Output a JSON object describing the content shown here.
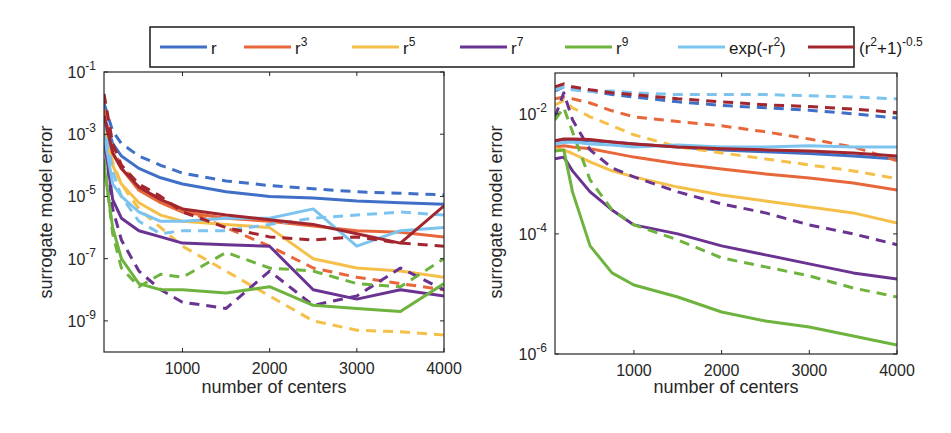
{
  "legend": {
    "position": "top-outside",
    "entries": [
      {
        "key": "r",
        "base": "r",
        "sup": "",
        "suffix": "",
        "color": "#3f6fc6"
      },
      {
        "key": "r3",
        "base": "r",
        "sup": "3",
        "suffix": "",
        "color": "#e8673a"
      },
      {
        "key": "r5",
        "base": "r",
        "sup": "5",
        "suffix": "",
        "color": "#f5c04a"
      },
      {
        "key": "r7",
        "base": "r",
        "sup": "7",
        "suffix": "",
        "color": "#6a3391"
      },
      {
        "key": "r9",
        "base": "r",
        "sup": "9",
        "suffix": "",
        "color": "#6fb33f"
      },
      {
        "key": "exp",
        "base": "exp(-r",
        "sup": "2",
        "suffix": ")",
        "color": "#7cc4ef"
      },
      {
        "key": "imq",
        "base": "(r",
        "sup": "2",
        "suffix": "+1)",
        "sup2": "-0.5",
        "color": "#a3262e"
      }
    ]
  },
  "chart_data": [
    {
      "type": "line",
      "title": "",
      "xlabel": "number of centers",
      "ylabel": "surrogate model error",
      "yscale": "log",
      "xlim": [
        100,
        4000
      ],
      "ylim_log10": [
        -10,
        -1
      ],
      "xticks": [
        1000,
        2000,
        3000,
        4000
      ],
      "xtick_labels": [
        "1000",
        "2000",
        "3000",
        "4000"
      ],
      "yticks_log10": [
        -1,
        -3,
        -5,
        -7,
        -9
      ],
      "ytick_labels": [
        {
          "base": "10",
          "exp": "-1"
        },
        {
          "base": "10",
          "exp": "-3"
        },
        {
          "base": "10",
          "exp": "-5"
        },
        {
          "base": "10",
          "exp": "-7"
        },
        {
          "base": "10",
          "exp": "-9"
        }
      ],
      "grid": false,
      "x": [
        100,
        200,
        300,
        500,
        750,
        1000,
        1500,
        2000,
        2500,
        3000,
        3500,
        4000
      ],
      "series_note": "values are log10(error); solid and dashed variants per kernel",
      "series": [
        {
          "name": "r",
          "style": "solid",
          "color": "#3f6fc6",
          "values": [
            -2.4,
            -3.3,
            -3.7,
            -4.1,
            -4.4,
            -4.6,
            -4.85,
            -5.0,
            -5.05,
            -5.15,
            -5.2,
            -5.25
          ]
        },
        {
          "name": "r",
          "style": "dashed",
          "color": "#3f6fc6",
          "values": [
            -2.0,
            -2.9,
            -3.3,
            -3.7,
            -4.0,
            -4.25,
            -4.5,
            -4.65,
            -4.75,
            -4.85,
            -4.9,
            -4.95
          ]
        },
        {
          "name": "r3",
          "style": "solid",
          "color": "#e8673a",
          "values": [
            -2.6,
            -3.6,
            -4.1,
            -4.8,
            -5.2,
            -5.5,
            -5.7,
            -5.8,
            -5.95,
            -6.1,
            -6.15,
            -6.3
          ]
        },
        {
          "name": "r3",
          "style": "dashed",
          "color": "#e8673a",
          "values": [
            -2.2,
            -3.5,
            -4.0,
            -4.7,
            -5.1,
            -5.4,
            -6.0,
            -6.6,
            -7.3,
            -7.6,
            -7.8,
            -8.0
          ]
        },
        {
          "name": "r5",
          "style": "solid",
          "color": "#f5c04a",
          "values": [
            -2.8,
            -4.0,
            -4.6,
            -5.2,
            -5.6,
            -5.8,
            -5.9,
            -6.0,
            -7.0,
            -7.3,
            -7.4,
            -7.6
          ]
        },
        {
          "name": "r5",
          "style": "dashed",
          "color": "#f5c04a",
          "values": [
            -2.6,
            -3.9,
            -4.6,
            -5.4,
            -6.0,
            -6.6,
            -7.4,
            -8.2,
            -9.0,
            -9.3,
            -9.35,
            -9.45
          ]
        },
        {
          "name": "r7",
          "style": "solid",
          "color": "#6a3391",
          "values": [
            -3.1,
            -5.1,
            -5.7,
            -6.1,
            -6.3,
            -6.5,
            -6.55,
            -6.6,
            -8.0,
            -8.3,
            -8.0,
            -8.2
          ]
        },
        {
          "name": "r7",
          "style": "dashed",
          "color": "#6a3391",
          "values": [
            -3.0,
            -5.4,
            -6.4,
            -7.4,
            -8.0,
            -8.4,
            -8.6,
            -7.4,
            -8.5,
            -8.2,
            -7.3,
            -8.0
          ]
        },
        {
          "name": "r9",
          "style": "solid",
          "color": "#6fb33f",
          "values": [
            -4.0,
            -6.0,
            -7.0,
            -7.8,
            -8.0,
            -8.0,
            -8.1,
            -7.9,
            -8.5,
            -8.6,
            -8.7,
            -7.8
          ]
        },
        {
          "name": "r9",
          "style": "dashed",
          "color": "#6fb33f",
          "values": [
            -3.8,
            -6.2,
            -7.3,
            -7.9,
            -7.5,
            -7.6,
            -6.8,
            -7.3,
            -7.4,
            -7.8,
            -7.9,
            -7.0
          ]
        },
        {
          "name": "exp(-r^2)",
          "style": "solid",
          "color": "#7cc4ef",
          "values": [
            -3.0,
            -4.6,
            -5.0,
            -5.5,
            -5.8,
            -5.8,
            -5.7,
            -5.7,
            -5.4,
            -6.6,
            -6.1,
            -6.0
          ]
        },
        {
          "name": "exp(-r^2)",
          "style": "dashed",
          "color": "#7cc4ef",
          "values": [
            -2.6,
            -4.2,
            -5.0,
            -5.8,
            -6.2,
            -6.1,
            -6.1,
            -5.9,
            -5.7,
            -5.6,
            -5.5,
            -5.6
          ]
        },
        {
          "name": "(r^2+1)^-0.5",
          "style": "solid",
          "color": "#a3262e",
          "values": [
            -2.4,
            -3.6,
            -4.1,
            -4.7,
            -5.1,
            -5.4,
            -5.6,
            -5.75,
            -5.9,
            -6.2,
            -6.5,
            -5.3
          ]
        },
        {
          "name": "(r^2+1)^-0.5",
          "style": "dashed",
          "color": "#a3262e",
          "values": [
            -1.7,
            -3.3,
            -4.0,
            -4.6,
            -5.0,
            -5.5,
            -6.0,
            -6.3,
            -6.4,
            -6.3,
            -6.5,
            -6.6
          ]
        }
      ]
    },
    {
      "type": "line",
      "title": "",
      "xlabel": "number of centers",
      "ylabel": "surrogate model error",
      "yscale": "log",
      "xlim": [
        100,
        4000
      ],
      "ylim_log10": [
        -6,
        -1.32
      ],
      "xticks": [
        1000,
        2000,
        3000,
        4000
      ],
      "xtick_labels": [
        "1000",
        "2000",
        "3000",
        "4000"
      ],
      "yticks_log10": [
        -2,
        -4,
        -6
      ],
      "ytick_labels": [
        {
          "base": "10",
          "exp": "-2"
        },
        {
          "base": "10",
          "exp": "-4"
        },
        {
          "base": "10",
          "exp": "-6"
        }
      ],
      "grid": false,
      "x": [
        100,
        200,
        300,
        500,
        750,
        1000,
        1500,
        2000,
        2500,
        3000,
        3500,
        4000
      ],
      "series_note": "values are log10(error); solid and dashed variants per kernel",
      "series": [
        {
          "name": "r",
          "style": "solid",
          "color": "#3f6fc6",
          "values": [
            -2.45,
            -2.43,
            -2.43,
            -2.45,
            -2.47,
            -2.5,
            -2.55,
            -2.6,
            -2.63,
            -2.66,
            -2.7,
            -2.75
          ]
        },
        {
          "name": "r",
          "style": "dashed",
          "color": "#3f6fc6",
          "values": [
            -1.62,
            -1.55,
            -1.58,
            -1.62,
            -1.68,
            -1.72,
            -1.8,
            -1.86,
            -1.9,
            -1.94,
            -2.0,
            -2.07
          ]
        },
        {
          "name": "r3",
          "style": "solid",
          "color": "#e8673a",
          "values": [
            -2.55,
            -2.53,
            -2.55,
            -2.58,
            -2.65,
            -2.72,
            -2.83,
            -2.92,
            -3.0,
            -3.07,
            -3.15,
            -3.27
          ]
        },
        {
          "name": "r3",
          "style": "dashed",
          "color": "#e8673a",
          "values": [
            -1.75,
            -1.72,
            -1.75,
            -1.82,
            -1.95,
            -2.05,
            -2.13,
            -2.2,
            -2.3,
            -2.42,
            -2.55,
            -2.78
          ]
        },
        {
          "name": "r5",
          "style": "solid",
          "color": "#f5c04a",
          "values": [
            -2.58,
            -2.6,
            -2.66,
            -2.8,
            -2.95,
            -3.05,
            -3.22,
            -3.35,
            -3.45,
            -3.55,
            -3.65,
            -3.82
          ]
        },
        {
          "name": "r5",
          "style": "dashed",
          "color": "#f5c04a",
          "values": [
            -1.85,
            -1.78,
            -1.9,
            -2.05,
            -2.2,
            -2.35,
            -2.55,
            -2.65,
            -2.75,
            -2.85,
            -2.95,
            -3.08
          ]
        },
        {
          "name": "r7",
          "style": "solid",
          "color": "#6a3391",
          "values": [
            -2.75,
            -2.72,
            -2.95,
            -3.3,
            -3.6,
            -3.85,
            -4.0,
            -4.2,
            -4.35,
            -4.5,
            -4.65,
            -4.75
          ]
        },
        {
          "name": "r7",
          "style": "dashed",
          "color": "#6a3391",
          "values": [
            -2.05,
            -1.65,
            -2.1,
            -2.6,
            -2.9,
            -3.05,
            -3.3,
            -3.5,
            -3.65,
            -3.85,
            -4.0,
            -4.18
          ]
        },
        {
          "name": "r9",
          "style": "solid",
          "color": "#6fb33f",
          "values": [
            -2.62,
            -2.6,
            -3.3,
            -4.2,
            -4.65,
            -4.85,
            -5.05,
            -5.3,
            -5.45,
            -5.55,
            -5.7,
            -5.85
          ]
        },
        {
          "name": "r9",
          "style": "dashed",
          "color": "#6fb33f",
          "values": [
            -2.1,
            -1.9,
            -2.3,
            -3.1,
            -3.6,
            -3.85,
            -4.1,
            -4.4,
            -4.55,
            -4.7,
            -4.9,
            -5.05
          ]
        },
        {
          "name": "exp(-r^2)",
          "style": "solid",
          "color": "#7cc4ef",
          "values": [
            -2.5,
            -2.48,
            -2.47,
            -2.5,
            -2.52,
            -2.55,
            -2.52,
            -2.55,
            -2.55,
            -2.53,
            -2.55,
            -2.55
          ]
        },
        {
          "name": "exp(-r^2)",
          "style": "dashed",
          "color": "#7cc4ef",
          "values": [
            -1.6,
            -1.55,
            -1.6,
            -1.63,
            -1.62,
            -1.65,
            -1.68,
            -1.68,
            -1.68,
            -1.7,
            -1.72,
            -1.75
          ]
        },
        {
          "name": "(r^2+1)^-0.5",
          "style": "solid",
          "color": "#a3262e",
          "values": [
            -2.45,
            -2.42,
            -2.42,
            -2.43,
            -2.47,
            -2.5,
            -2.55,
            -2.58,
            -2.6,
            -2.62,
            -2.65,
            -2.7
          ]
        },
        {
          "name": "(r^2+1)^-0.5",
          "style": "dashed",
          "color": "#a3262e",
          "values": [
            -1.55,
            -1.5,
            -1.55,
            -1.6,
            -1.65,
            -1.68,
            -1.75,
            -1.8,
            -1.85,
            -1.88,
            -1.92,
            -1.98
          ]
        }
      ]
    }
  ]
}
